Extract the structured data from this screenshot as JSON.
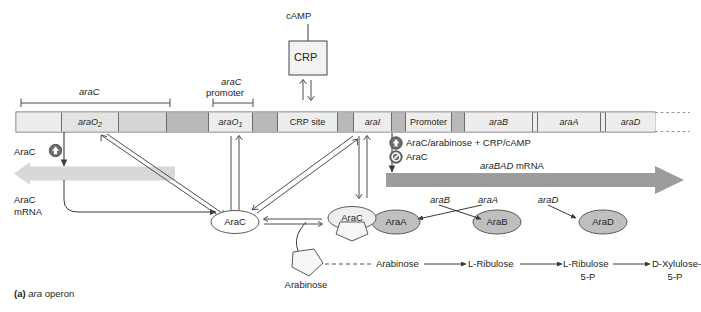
{
  "figure": {
    "caption_prefix": "(a)",
    "caption_text": "ara operon",
    "caption_italic_part": "ara",
    "caption_rest": "operon"
  },
  "colors": {
    "dna_light": "#ededed",
    "dna_mid": "#d9d9d9",
    "dna_dark": "#b3b3b3",
    "mrna_left_arrow": "#d6d6d6",
    "mrna_right_arrow": "#9a9a9a",
    "protein_fill": "#c0c0c0",
    "outline": "#4d4d4d",
    "text": "#231f20"
  },
  "top": {
    "camp_label": "cAMP",
    "crp_box_label": "CRP"
  },
  "brackets": {
    "arac_gene": "araC",
    "arac_promoter_line1": "araC",
    "arac_promoter_line2": "promoter"
  },
  "dna_map": {
    "segments": [
      {
        "name": "spacer-left",
        "label": "",
        "shade": "light"
      },
      {
        "name": "araO2",
        "label": "araO",
        "subscript": "2",
        "shade": "light"
      },
      {
        "name": "spacer-2",
        "label": "",
        "shade": "light"
      },
      {
        "name": "arac-coding",
        "label": "",
        "shade": "dark"
      },
      {
        "name": "spacer-3",
        "label": "",
        "shade": "light"
      },
      {
        "name": "araO1",
        "label": "araO",
        "subscript": "1",
        "shade": "light"
      },
      {
        "name": "spacer-4",
        "label": "",
        "shade": "dark"
      },
      {
        "name": "crp-site",
        "label": "CRP site",
        "shade": "light"
      },
      {
        "name": "spacer-5",
        "label": "",
        "shade": "dark"
      },
      {
        "name": "araI",
        "label": "araI",
        "shade": "light"
      },
      {
        "name": "spacer-6",
        "label": "",
        "shade": "dark"
      },
      {
        "name": "promoter",
        "label": "Promoter",
        "shade": "light"
      },
      {
        "name": "spacer-7",
        "label": "",
        "shade": "dark"
      },
      {
        "name": "araB",
        "label": "araB",
        "shade": "light"
      },
      {
        "name": "araA",
        "label": "araA",
        "shade": "light"
      },
      {
        "name": "araD",
        "label": "araD",
        "shade": "light"
      }
    ]
  },
  "left_side": {
    "arac_activate_label": "AraC",
    "arac_mrna_line1": "AraC",
    "arac_mrna_line2": "mRNA",
    "arac_protein_oval": "AraC"
  },
  "legend": {
    "activate_text": "AraC/arabinose + CRP/cAMP",
    "repress_text": "AraC",
    "activate_icon": "circled-up-arrow-icon",
    "repress_icon": "circled-slash-icon"
  },
  "right_side": {
    "mrna_label_italic": "araBAD",
    "mrna_label_rest": " mRNA",
    "gene_labels": [
      "araB",
      "araA",
      "araD"
    ],
    "proteins": [
      "AraA",
      "AraB",
      "AraD"
    ]
  },
  "middle": {
    "arac_free": "AraC",
    "arac_bound": "AraC",
    "arabinose_molecule_label": "Arabinose"
  },
  "pathway": {
    "steps": [
      {
        "name": "arabinose",
        "line1": "Arabinose",
        "line2": ""
      },
      {
        "name": "l-ribulose",
        "line1": "L-Ribulose",
        "line2": ""
      },
      {
        "name": "l-ribulose-5p",
        "line1": "L-Ribulose",
        "line2": "5-P"
      },
      {
        "name": "d-xylulose-5p",
        "line1": "D-Xylulose-",
        "line2": "5-P"
      }
    ]
  }
}
